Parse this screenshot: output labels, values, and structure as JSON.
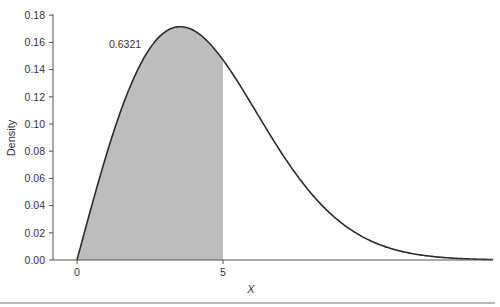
{
  "chart_data": {
    "type": "area",
    "title": "",
    "xlabel": "X",
    "ylabel": "Density",
    "xlim": [
      0,
      14.25
    ],
    "ylim": [
      0,
      0.18
    ],
    "grid": false,
    "x_ticks": [
      0,
      5
    ],
    "x_tick_labels": [
      "0",
      "5"
    ],
    "y_ticks": [
      0.0,
      0.02,
      0.04,
      0.06,
      0.08,
      0.1,
      0.12,
      0.14,
      0.16,
      0.18
    ],
    "y_tick_labels": [
      "0.00",
      "0.02",
      "0.04",
      "0.06",
      "0.08",
      "0.10",
      "0.12",
      "0.14",
      "0.16",
      "0.18"
    ],
    "shaded_region": {
      "from": 0,
      "to": 5,
      "color": "#bdbdbd"
    },
    "annotations": [
      {
        "text": "0.6321",
        "x": 1.2,
        "y": 0.16
      }
    ],
    "series": [
      {
        "name": "density",
        "x": [
          0,
          0.5,
          1,
          1.5,
          2,
          2.5,
          3,
          3.5,
          4,
          4.5,
          5,
          5.5,
          6,
          6.5,
          7,
          7.5,
          8,
          8.5,
          9,
          9.5,
          10,
          11,
          12,
          13,
          14,
          14.25
        ],
        "values": [
          0,
          0.0396,
          0.0769,
          0.1095,
          0.1362,
          0.1558,
          0.1674,
          0.1713,
          0.1682,
          0.16,
          0.1472,
          0.1316,
          0.1137,
          0.0957,
          0.0788,
          0.0632,
          0.0495,
          0.038,
          0.0281,
          0.0206,
          0.0147,
          0.0069,
          0.003,
          0.0012,
          0.0004,
          0.0003
        ]
      }
    ]
  },
  "colors": {
    "curve": "#2b2b2b",
    "shade": "#bdbdbd",
    "axis": "#555555"
  }
}
